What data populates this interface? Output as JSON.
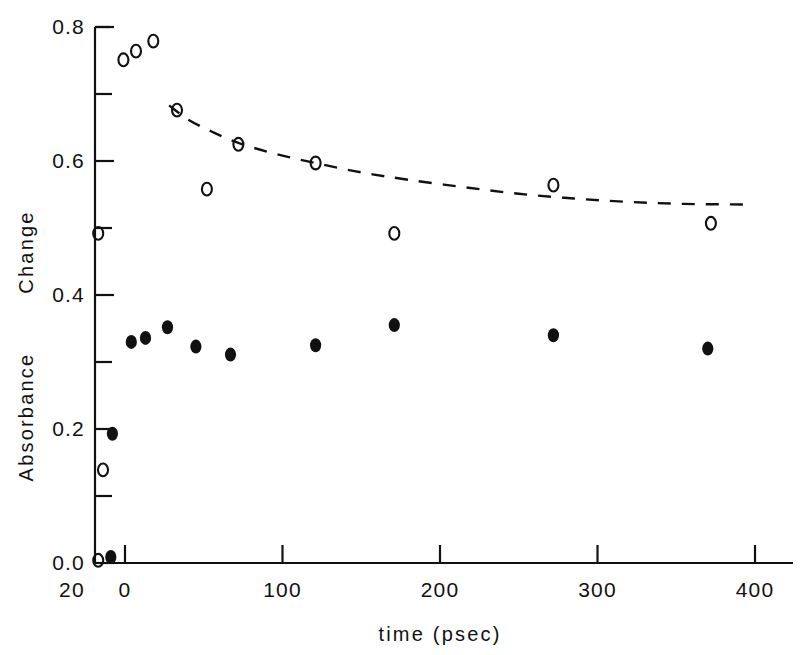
{
  "chart_data": {
    "type": "scatter",
    "title": "",
    "xlabel": "time (psec)",
    "ylabel_upper": "Change",
    "ylabel_lower": "Absorbance",
    "xlim": [
      -24,
      410
    ],
    "ylim": [
      -0.02,
      0.8
    ],
    "grid": false,
    "legend": "none",
    "x_ticks": [
      0,
      100,
      200,
      300,
      400
    ],
    "x_tick_labels": [
      "0",
      "100",
      "200",
      "300",
      "400"
    ],
    "x_extra_tick_label": "20",
    "y_ticks": [
      0.0,
      0.2,
      0.4,
      0.6,
      0.8
    ],
    "y_tick_labels": [
      "0.0",
      "0.2",
      "0.4",
      "0.6",
      "0.8"
    ],
    "y_minor_ticks": [
      0.1,
      0.3,
      0.5,
      0.7
    ],
    "series": [
      {
        "name": "open-circles",
        "marker": "open-circle",
        "points": [
          {
            "x": -17,
            "y": 0.004
          },
          {
            "x": -14,
            "y": 0.139
          },
          {
            "x": -17,
            "y": 0.492
          },
          {
            "x": -1,
            "y": 0.751
          },
          {
            "x": 7,
            "y": 0.764
          },
          {
            "x": 18,
            "y": 0.779
          },
          {
            "x": 33,
            "y": 0.676
          },
          {
            "x": 52,
            "y": 0.558
          },
          {
            "x": 72,
            "y": 0.625
          },
          {
            "x": 121,
            "y": 0.597
          },
          {
            "x": 171,
            "y": 0.492
          },
          {
            "x": 272,
            "y": 0.564
          },
          {
            "x": 372,
            "y": 0.507
          }
        ]
      },
      {
        "name": "filled-circles",
        "marker": "filled-circle",
        "points": [
          {
            "x": -9,
            "y": 0.009
          },
          {
            "x": -8,
            "y": 0.193
          },
          {
            "x": 4,
            "y": 0.33
          },
          {
            "x": 13,
            "y": 0.336
          },
          {
            "x": 27,
            "y": 0.352
          },
          {
            "x": 45,
            "y": 0.323
          },
          {
            "x": 67,
            "y": 0.311
          },
          {
            "x": 121,
            "y": 0.325
          },
          {
            "x": 171,
            "y": 0.355
          },
          {
            "x": 272,
            "y": 0.34
          },
          {
            "x": 370,
            "y": 0.32
          }
        ]
      }
    ],
    "fit_curve": {
      "name": "dashed-fit-curve",
      "style": "dashed",
      "points": [
        {
          "x": 28,
          "y": 0.683
        },
        {
          "x": 40,
          "y": 0.662
        },
        {
          "x": 55,
          "y": 0.644
        },
        {
          "x": 72,
          "y": 0.627
        },
        {
          "x": 95,
          "y": 0.611
        },
        {
          "x": 121,
          "y": 0.597
        },
        {
          "x": 150,
          "y": 0.583
        },
        {
          "x": 180,
          "y": 0.572
        },
        {
          "x": 215,
          "y": 0.561
        },
        {
          "x": 250,
          "y": 0.551
        },
        {
          "x": 285,
          "y": 0.544
        },
        {
          "x": 320,
          "y": 0.539
        },
        {
          "x": 355,
          "y": 0.536
        },
        {
          "x": 395,
          "y": 0.535
        }
      ]
    }
  },
  "colors": {
    "ink": "#111111",
    "background": "#ffffff"
  }
}
